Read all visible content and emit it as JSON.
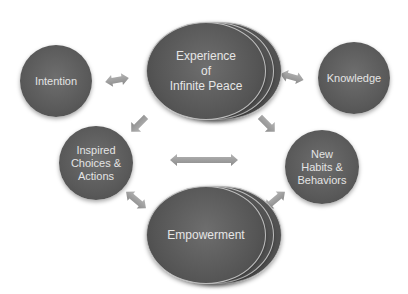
{
  "diagram": {
    "center_top": {
      "label": "Experience of Infinite Peace",
      "lines": [
        "Experience",
        "of",
        "Infinite Peace"
      ]
    },
    "center_bottom": {
      "label": "Empowerment"
    },
    "left_top": {
      "label": "Intention"
    },
    "right_top": {
      "label": "Knowledge"
    },
    "left_bottom": {
      "lines": [
        "Inspired",
        "Choices &",
        "Actions"
      ]
    },
    "right_bottom": {
      "lines": [
        "New",
        "Habits &",
        "Behaviors"
      ]
    }
  },
  "colors": {
    "node_fill": "#5a5a5a",
    "node_text": "#e4e4e4",
    "arrow": "#9a9a9a",
    "background": "#ffffff"
  }
}
